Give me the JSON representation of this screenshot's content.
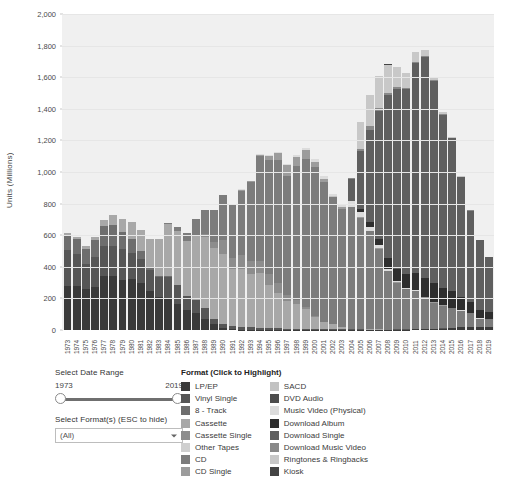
{
  "chart_data": {
    "type": "bar",
    "subtype": "stacked",
    "title": "",
    "xlabel": "",
    "ylabel": "Units (Millions)",
    "ylim": [
      0,
      2000
    ],
    "ytick_step": 200,
    "ytick_labels": [
      "0",
      "200",
      "400",
      "600",
      "800",
      "1,000",
      "1,200",
      "1,400",
      "1,600",
      "1,800",
      "2,000"
    ],
    "grid": true,
    "legend_position": "bottom-right",
    "categories": [
      "1973",
      "1974",
      "1975",
      "1976",
      "1977",
      "1978",
      "1979",
      "1980",
      "1981",
      "1982",
      "1983",
      "1984",
      "1985",
      "1986",
      "1987",
      "1988",
      "1989",
      "1990",
      "1991",
      "1992",
      "1993",
      "1994",
      "1995",
      "1996",
      "1997",
      "1998",
      "1999",
      "2000",
      "2001",
      "2002",
      "2003",
      "2004",
      "2005",
      "2006",
      "2007",
      "2008",
      "2009",
      "2010",
      "2011",
      "2012",
      "2013",
      "2014",
      "2015",
      "2016",
      "2017",
      "2018",
      "2019"
    ],
    "series": [
      {
        "name": "LP/EP",
        "color": "#3a3a3a",
        "values": [
          280,
          276,
          257,
          273,
          344,
          341,
          318,
          323,
          295,
          244,
          210,
          205,
          167,
          125,
          107,
          72,
          35,
          12,
          5,
          2,
          1,
          1,
          1,
          1,
          1,
          1,
          1,
          1,
          1,
          1,
          1,
          1,
          1,
          1,
          1,
          1,
          2,
          3,
          4,
          5,
          6,
          9,
          12,
          17,
          16,
          17,
          19
        ]
      },
      {
        "name": "Vinyl Single",
        "color": "#565656",
        "values": [
          228,
          204,
          164,
          190,
          190,
          190,
          195,
          164,
          154,
          137,
          125,
          132,
          120,
          93,
          82,
          65,
          37,
          28,
          22,
          20,
          15,
          12,
          10,
          10,
          8,
          6,
          6,
          5,
          5,
          4,
          3,
          3,
          3,
          2,
          2,
          2,
          2,
          2,
          2,
          2,
          2,
          2,
          2,
          2,
          2,
          2,
          2
        ]
      },
      {
        "name": "8 - Track",
        "color": "#6e6e6e",
        "values": [
          91,
          96,
          94,
          106,
          127,
          133,
          105,
          86,
          49,
          14,
          6,
          2,
          1,
          0,
          0,
          0,
          0,
          0,
          0,
          0,
          0,
          0,
          0,
          0,
          0,
          0,
          0,
          0,
          0,
          0,
          0,
          0,
          0,
          0,
          0,
          0,
          0,
          0,
          0,
          0,
          0,
          0,
          0,
          0,
          0,
          0,
          0
        ]
      },
      {
        "name": "Cassette",
        "color": "#a8a8a8",
        "values": [
          15,
          15,
          16,
          22,
          36,
          61,
          83,
          110,
          137,
          182,
          237,
          332,
          339,
          345,
          410,
          450,
          446,
          442,
          360,
          366,
          339,
          345,
          273,
          225,
          173,
          159,
          124,
          76,
          45,
          31,
          17,
          5,
          3,
          1,
          1,
          0,
          0,
          0,
          0,
          0,
          0,
          0,
          0,
          0,
          0,
          0,
          0
        ]
      },
      {
        "name": "Cassette Single",
        "color": "#8d8d8d",
        "values": [
          0,
          0,
          0,
          0,
          0,
          0,
          0,
          0,
          0,
          0,
          0,
          0,
          0,
          0,
          5,
          22,
          37,
          87,
          70,
          85,
          85,
          81,
          70,
          60,
          42,
          26,
          14,
          5,
          2,
          1,
          0,
          0,
          0,
          0,
          0,
          0,
          0,
          0,
          0,
          0,
          0,
          0,
          0,
          0,
          0,
          0,
          0
        ]
      },
      {
        "name": "Other Tapes",
        "color": "#cfcfcf",
        "values": [
          0,
          0,
          0,
          0,
          0,
          0,
          0,
          0,
          0,
          0,
          0,
          0,
          0,
          0,
          0,
          0,
          0,
          0,
          0,
          0,
          0,
          0,
          0,
          0,
          0,
          0,
          0,
          0,
          0,
          0,
          0,
          0,
          0,
          0,
          0,
          0,
          0,
          0,
          0,
          0,
          0,
          0,
          0,
          0,
          0,
          0,
          0
        ]
      },
      {
        "name": "CD",
        "color": "#7c7c7c",
        "values": [
          0,
          0,
          0,
          0,
          0,
          0,
          0,
          0,
          0,
          0,
          0,
          6,
          23,
          53,
          102,
          150,
          207,
          287,
          333,
          408,
          495,
          662,
          723,
          779,
          753,
          847,
          939,
          942,
          882,
          803,
          746,
          767,
          705,
          620,
          511,
          368,
          296,
          253,
          241,
          198,
          166,
          144,
          123,
          103,
          88,
          53,
          47
        ]
      },
      {
        "name": "CD Single",
        "color": "#9c9c9c",
        "values": [
          0,
          0,
          0,
          0,
          0,
          0,
          0,
          0,
          0,
          0,
          0,
          0,
          0,
          0,
          0,
          0,
          0,
          0,
          6,
          8,
          8,
          9,
          22,
          43,
          67,
          56,
          56,
          34,
          18,
          5,
          9,
          3,
          3,
          2,
          3,
          2,
          1,
          1,
          1,
          1,
          1,
          1,
          1,
          1,
          1,
          1,
          1
        ]
      },
      {
        "name": "SACD",
        "color": "#c2c2c2",
        "values": [
          0,
          0,
          0,
          0,
          0,
          0,
          0,
          0,
          0,
          0,
          0,
          0,
          0,
          0,
          0,
          0,
          0,
          0,
          0,
          0,
          0,
          0,
          0,
          0,
          0,
          0,
          0,
          0,
          0,
          1,
          1,
          1,
          1,
          1,
          0,
          0,
          0,
          0,
          0,
          0,
          0,
          0,
          0,
          0,
          0,
          0,
          0
        ]
      },
      {
        "name": "DVD Audio",
        "color": "#4d4d4d",
        "values": [
          0,
          0,
          0,
          0,
          0,
          0,
          0,
          0,
          0,
          0,
          0,
          0,
          0,
          0,
          0,
          0,
          0,
          0,
          0,
          0,
          0,
          0,
          0,
          0,
          0,
          0,
          0,
          0,
          1,
          1,
          1,
          1,
          1,
          1,
          0,
          0,
          0,
          0,
          0,
          0,
          0,
          0,
          0,
          0,
          0,
          0,
          0
        ]
      },
      {
        "name": "Music Video (Physical)",
        "color": "#dcdcdc",
        "values": [
          0,
          0,
          0,
          0,
          0,
          0,
          0,
          0,
          0,
          0,
          0,
          0,
          0,
          0,
          0,
          0,
          0,
          0,
          0,
          2,
          3,
          5,
          6,
          8,
          10,
          13,
          15,
          18,
          18,
          17,
          19,
          33,
          33,
          25,
          19,
          14,
          10,
          8,
          6,
          5,
          4,
          3,
          3,
          2,
          2,
          2,
          2
        ]
      },
      {
        "name": "Download Album",
        "color": "#2e2e2e",
        "values": [
          0,
          0,
          0,
          0,
          0,
          0,
          0,
          0,
          0,
          0,
          0,
          0,
          0,
          0,
          0,
          0,
          0,
          0,
          0,
          0,
          0,
          0,
          0,
          0,
          0,
          0,
          0,
          0,
          0,
          0,
          0,
          5,
          14,
          28,
          42,
          66,
          76,
          86,
          104,
          118,
          118,
          107,
          109,
          87,
          66,
          51,
          42
        ]
      },
      {
        "name": "Download Single",
        "color": "#5f5f5f",
        "values": [
          0,
          0,
          0,
          0,
          0,
          0,
          0,
          0,
          0,
          0,
          0,
          0,
          0,
          0,
          0,
          0,
          0,
          0,
          0,
          0,
          0,
          0,
          0,
          0,
          0,
          0,
          0,
          0,
          0,
          0,
          0,
          140,
          367,
          588,
          810,
          1033,
          1138,
          1171,
          1331,
          1400,
          1281,
          1098,
          964,
          754,
          580,
          442,
          348
        ]
      },
      {
        "name": "Download Music Video",
        "color": "#898989",
        "values": [
          0,
          0,
          0,
          0,
          0,
          0,
          0,
          0,
          0,
          0,
          0,
          0,
          0,
          0,
          0,
          0,
          0,
          0,
          0,
          0,
          0,
          0,
          0,
          0,
          0,
          0,
          0,
          0,
          0,
          0,
          0,
          2,
          14,
          20,
          18,
          14,
          12,
          10,
          8,
          6,
          5,
          4,
          3,
          2,
          2,
          1,
          1
        ]
      },
      {
        "name": "Ringtones & Ringbacks",
        "color": "#c8c8c8",
        "values": [
          0,
          0,
          0,
          0,
          0,
          0,
          0,
          0,
          0,
          0,
          0,
          0,
          0,
          0,
          0,
          0,
          0,
          0,
          0,
          0,
          0,
          0,
          0,
          0,
          0,
          0,
          0,
          0,
          0,
          0,
          0,
          0,
          170,
          200,
          200,
          180,
          130,
          90,
          60,
          35,
          20,
          12,
          7,
          4,
          2,
          1,
          1
        ]
      },
      {
        "name": "Kiosk",
        "color": "#444444",
        "values": [
          0,
          0,
          0,
          0,
          0,
          0,
          0,
          0,
          0,
          0,
          0,
          0,
          0,
          0,
          0,
          0,
          0,
          0,
          0,
          0,
          0,
          0,
          0,
          0,
          0,
          0,
          0,
          0,
          0,
          0,
          0,
          0,
          1,
          1,
          1,
          1,
          1,
          1,
          0,
          0,
          0,
          0,
          0,
          0,
          0,
          0,
          0
        ]
      }
    ]
  },
  "controls": {
    "date_range_title": "Select Date Range",
    "range_min": "1973",
    "range_max": "2019",
    "format_title": "Select Format(s) (ESC to hide)",
    "format_value": "(All)"
  },
  "legend": {
    "title": "Format (Click to Highlight)",
    "column_left": [
      {
        "label": "LP/EP",
        "color": "#3a3a3a"
      },
      {
        "label": "Vinyl Single",
        "color": "#565656"
      },
      {
        "label": "8 - Track",
        "color": "#6e6e6e"
      },
      {
        "label": "Cassette",
        "color": "#a8a8a8"
      },
      {
        "label": "Cassette Single",
        "color": "#8d8d8d"
      },
      {
        "label": "Other Tapes",
        "color": "#cfcfcf"
      },
      {
        "label": "CD",
        "color": "#7c7c7c"
      },
      {
        "label": "CD Single",
        "color": "#9c9c9c"
      }
    ],
    "column_right": [
      {
        "label": "SACD",
        "color": "#c2c2c2"
      },
      {
        "label": "DVD Audio",
        "color": "#4d4d4d"
      },
      {
        "label": "Music Video (Physical)",
        "color": "#dcdcdc"
      },
      {
        "label": "Download Album",
        "color": "#2e2e2e"
      },
      {
        "label": "Download Single",
        "color": "#5f5f5f"
      },
      {
        "label": "Download Music Video",
        "color": "#898989"
      },
      {
        "label": "Ringtones & Ringbacks",
        "color": "#c8c8c8"
      },
      {
        "label": "Kiosk",
        "color": "#444444"
      }
    ]
  }
}
